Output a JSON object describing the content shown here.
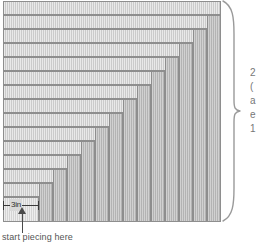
{
  "diagram": {
    "colors": {
      "light_strip": "#cfcfcf",
      "dark_strip": "#b9b9b9",
      "core_strip": "#d8d8d8",
      "outline": "#8e8e8e",
      "annotation": "#555555",
      "arrow": "#4a4a4a"
    },
    "measure_label": {
      "text": "3in",
      "name": "three-inch-measure"
    },
    "start_caption": "start piecing here",
    "right_note": {
      "lines": [
        "2",
        "(",
        "a",
        "e",
        "1"
      ]
    },
    "strips": [
      {
        "name": "core-square",
        "kind": "core",
        "x": 3,
        "y": 197,
        "w": 36,
        "h": 25
      },
      {
        "name": "h-strip-1",
        "kind": "h",
        "x": 3,
        "y": 183,
        "w": 50,
        "h": 14
      },
      {
        "name": "v-strip-1",
        "kind": "v",
        "x": 39,
        "y": 183,
        "w": 14,
        "h": 39
      },
      {
        "name": "h-strip-2",
        "kind": "h",
        "x": 3,
        "y": 169,
        "w": 64,
        "h": 14
      },
      {
        "name": "v-strip-2",
        "kind": "v",
        "x": 53,
        "y": 169,
        "w": 14,
        "h": 53
      },
      {
        "name": "h-strip-3",
        "kind": "h",
        "x": 3,
        "y": 155,
        "w": 78,
        "h": 14
      },
      {
        "name": "v-strip-3",
        "kind": "v",
        "x": 67,
        "y": 155,
        "w": 14,
        "h": 67
      },
      {
        "name": "h-strip-4",
        "kind": "h",
        "x": 3,
        "y": 141,
        "w": 92,
        "h": 14
      },
      {
        "name": "v-strip-4",
        "kind": "v",
        "x": 81,
        "y": 141,
        "w": 14,
        "h": 81
      },
      {
        "name": "h-strip-5",
        "kind": "h",
        "x": 3,
        "y": 127,
        "w": 106,
        "h": 14
      },
      {
        "name": "v-strip-5",
        "kind": "v",
        "x": 95,
        "y": 127,
        "w": 14,
        "h": 95
      },
      {
        "name": "h-strip-6",
        "kind": "h",
        "x": 3,
        "y": 113,
        "w": 120,
        "h": 14
      },
      {
        "name": "v-strip-6",
        "kind": "v",
        "x": 109,
        "y": 113,
        "w": 14,
        "h": 109
      },
      {
        "name": "h-strip-7",
        "kind": "h",
        "x": 3,
        "y": 99,
        "w": 134,
        "h": 14
      },
      {
        "name": "v-strip-7",
        "kind": "v",
        "x": 123,
        "y": 99,
        "w": 14,
        "h": 123
      },
      {
        "name": "h-strip-8",
        "kind": "h",
        "x": 3,
        "y": 85,
        "w": 148,
        "h": 14
      },
      {
        "name": "v-strip-8",
        "kind": "v",
        "x": 137,
        "y": 85,
        "w": 14,
        "h": 137
      },
      {
        "name": "h-strip-9",
        "kind": "h",
        "x": 3,
        "y": 71,
        "w": 162,
        "h": 14
      },
      {
        "name": "v-strip-9",
        "kind": "v",
        "x": 151,
        "y": 71,
        "w": 14,
        "h": 151
      },
      {
        "name": "h-strip-10",
        "kind": "h",
        "x": 3,
        "y": 57,
        "w": 176,
        "h": 14
      },
      {
        "name": "v-strip-10",
        "kind": "v",
        "x": 165,
        "y": 57,
        "w": 14,
        "h": 165
      },
      {
        "name": "h-strip-11",
        "kind": "h",
        "x": 3,
        "y": 43,
        "w": 190,
        "h": 14
      },
      {
        "name": "v-strip-11",
        "kind": "v",
        "x": 179,
        "y": 43,
        "w": 14,
        "h": 179
      },
      {
        "name": "h-strip-12",
        "kind": "h",
        "x": 3,
        "y": 29,
        "w": 204,
        "h": 14
      },
      {
        "name": "v-strip-12",
        "kind": "v",
        "x": 193,
        "y": 29,
        "w": 14,
        "h": 193
      },
      {
        "name": "h-strip-13",
        "kind": "h",
        "x": 3,
        "y": 15,
        "w": 218,
        "h": 14
      },
      {
        "name": "v-strip-13",
        "kind": "v",
        "x": 207,
        "y": 15,
        "w": 14,
        "h": 207
      },
      {
        "name": "h-strip-14",
        "kind": "h",
        "x": 3,
        "y": 1,
        "w": 218,
        "h": 14
      }
    ]
  }
}
